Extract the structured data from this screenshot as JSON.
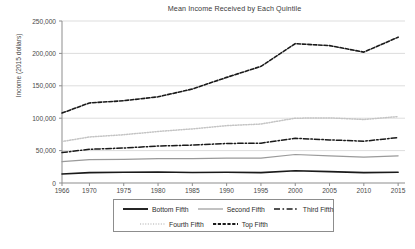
{
  "chart_data": {
    "type": "line",
    "title": "Mean Income Received by Each Quintile",
    "xlabel": "",
    "ylabel": "Income (2015 dollars)",
    "xlim": [
      1966,
      2016
    ],
    "ylim": [
      0,
      250000
    ],
    "ytick_labels": [
      "250,000",
      "200,000",
      "150,000",
      "100,000",
      "50,000",
      "0"
    ],
    "ytick_values": [
      250000,
      200000,
      150000,
      100000,
      50000,
      0
    ],
    "xtick_labels": [
      "1966",
      "1970",
      "1975",
      "1980",
      "1985",
      "1990",
      "1995",
      "2000",
      "2005",
      "2010",
      "2015"
    ],
    "xtick_values": [
      1966,
      1970,
      1975,
      1980,
      1985,
      1990,
      1995,
      2000,
      2005,
      2010,
      2015
    ],
    "grid": "horizontal",
    "legend_position": "below",
    "x": [
      1966,
      1970,
      1975,
      1980,
      1985,
      1990,
      1995,
      2000,
      2005,
      2010,
      2015
    ],
    "series": [
      {
        "name": "Bottom Fifth",
        "style": "solid",
        "color": "#1a1a1a",
        "width": 1.6,
        "values": [
          14000,
          16000,
          16500,
          17000,
          16200,
          16500,
          16000,
          19000,
          17500,
          16000,
          16500
        ]
      },
      {
        "name": "Second Fifth",
        "style": "solid",
        "color": "#9a9a9a",
        "width": 1.2,
        "values": [
          33000,
          36000,
          36500,
          37500,
          37500,
          38500,
          38500,
          44000,
          42000,
          40000,
          42000
        ]
      },
      {
        "name": "Third Fifth",
        "style": "dashdot",
        "color": "#1a1a1a",
        "width": 1.5,
        "values": [
          47000,
          52000,
          54000,
          57000,
          58500,
          61000,
          61500,
          69000,
          66500,
          64500,
          70000
        ]
      },
      {
        "name": "Fourth Fifth",
        "style": "dotted",
        "color": "#c4c4c4",
        "width": 1.5,
        "values": [
          64000,
          71000,
          74500,
          79500,
          83500,
          88500,
          91000,
          100000,
          100500,
          98000,
          102500
        ]
      },
      {
        "name": "Top Fifth",
        "style": "dashed",
        "color": "#1a1a1a",
        "width": 1.6,
        "values": [
          108000,
          123500,
          127000,
          133000,
          145000,
          163000,
          180000,
          215000,
          212000,
          202000,
          225000
        ]
      }
    ]
  },
  "caption": ""
}
